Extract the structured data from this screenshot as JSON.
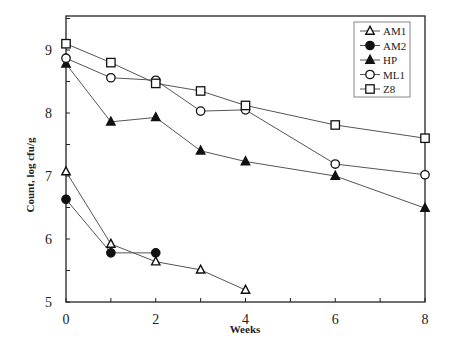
{
  "chart_data": {
    "type": "line",
    "title": "",
    "xlabel": "Weeks",
    "ylabel": "Count, log cfu/g",
    "xlim": [
      0,
      8
    ],
    "ylim": [
      5,
      9.5
    ],
    "x_ticks": [
      "0",
      "2",
      "4",
      "6",
      "8"
    ],
    "y_ticks": [
      "5",
      "6",
      "7",
      "8",
      "9"
    ],
    "grid": false,
    "legend_position": "upper right",
    "series": [
      {
        "name": "AM1",
        "marker": "open-triangle",
        "x": [
          0,
          1,
          2,
          3,
          4
        ],
        "values": [
          7.07,
          5.92,
          5.64,
          5.51,
          5.19
        ]
      },
      {
        "name": "AM2",
        "marker": "filled-circle",
        "x": [
          0,
          1,
          2
        ],
        "values": [
          6.63,
          5.78,
          5.78
        ]
      },
      {
        "name": "HP",
        "marker": "filled-triangle",
        "x": [
          0,
          1,
          2,
          3,
          4,
          6,
          8
        ],
        "values": [
          8.78,
          7.86,
          7.93,
          7.4,
          7.23,
          7.0,
          6.49
        ]
      },
      {
        "name": "ML1",
        "marker": "open-circle",
        "x": [
          0,
          1,
          2,
          3,
          4,
          6,
          8
        ],
        "values": [
          8.87,
          8.56,
          8.52,
          8.03,
          8.05,
          7.19,
          7.02
        ]
      },
      {
        "name": "Z8",
        "marker": "open-square",
        "x": [
          0,
          1,
          2,
          3,
          4,
          6,
          8
        ],
        "values": [
          9.1,
          8.8,
          8.47,
          8.35,
          8.12,
          7.81,
          7.6
        ]
      }
    ]
  },
  "axes": {
    "xlabel": "Weeks",
    "ylabel": "Count, log cfu/g"
  },
  "legend": {
    "items": [
      "AM1",
      "AM2",
      "HP",
      "ML1",
      "Z8"
    ]
  },
  "colors": {
    "line": "#555555",
    "marker": "#111111",
    "frame": "#222222"
  }
}
